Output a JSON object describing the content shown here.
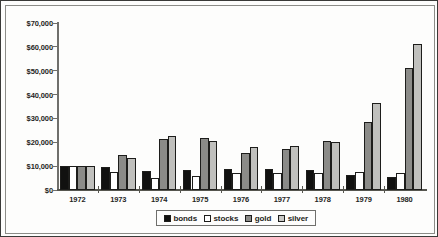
{
  "chart_data": {
    "type": "bar",
    "title": "",
    "subtitle": "",
    "xlabel": "",
    "ylabel": "",
    "grid": false,
    "legend_position": "bottom-center",
    "categories": [
      "1972",
      "1973",
      "1974",
      "1975",
      "1976",
      "1977",
      "1978",
      "1979",
      "1980"
    ],
    "ylim": [
      0,
      70000
    ],
    "ytick_values": [
      0,
      10000,
      20000,
      30000,
      40000,
      50000,
      60000,
      70000
    ],
    "ytick_labels": [
      "$0",
      "$10,000",
      "$20,000",
      "$30,000",
      "$40,000",
      "$50,000",
      "$60,000",
      "$70,000"
    ],
    "series": [
      {
        "name": "bonds",
        "color": "#111110",
        "values": [
          10000,
          9500,
          8000,
          8500,
          9000,
          9000,
          8500,
          6500,
          5500
        ]
      },
      {
        "name": "stocks",
        "color": "#ffffff",
        "values": [
          10000,
          7500,
          5000,
          6000,
          7000,
          7000,
          7000,
          7500,
          7000
        ]
      },
      {
        "name": "gold",
        "color": "#8b8b88",
        "values": [
          10000,
          14500,
          21500,
          22000,
          15500,
          17000,
          20500,
          28500,
          51000
        ]
      },
      {
        "name": "silver",
        "color": "#c0c0bd",
        "values": [
          10000,
          13500,
          22500,
          20500,
          18000,
          18500,
          20000,
          36500,
          61000
        ]
      }
    ]
  }
}
